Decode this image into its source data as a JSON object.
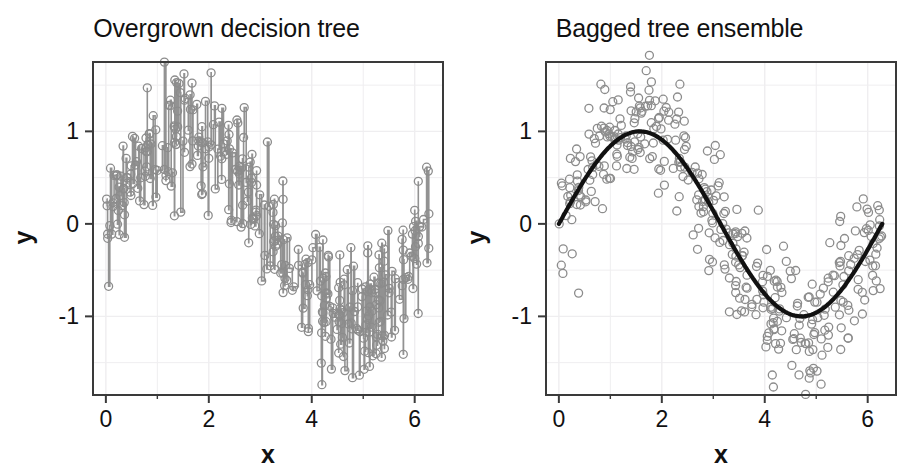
{
  "figure": {
    "background": "#ffffff",
    "panels": [
      {
        "id": "overgrown-decision-tree",
        "title": "Overgrown decision tree"
      },
      {
        "id": "bagged-tree-ensemble",
        "title": "Bagged tree ensemble"
      }
    ]
  },
  "axes": {
    "x_title": "x",
    "y_title": "y",
    "x_ticks": [
      "0",
      "2",
      "4",
      "6"
    ],
    "y_ticks": [
      "1",
      "0",
      "-1"
    ],
    "x_tick_values": [
      0,
      2,
      4,
      6
    ],
    "y_tick_values": [
      1,
      0,
      -1
    ]
  },
  "colors": {
    "point_stroke": "#8c8c8c",
    "fit_line": "#111111",
    "step_line": "#8c8c8c",
    "frame": "#3a3a3a",
    "grid": "#efeef0",
    "text": "#111111"
  },
  "chart_data": [
    {
      "type": "scatter",
      "title": "Overgrown decision tree",
      "xlabel": "x",
      "ylabel": "y",
      "xlim": [
        -0.25,
        6.55
      ],
      "ylim": [
        -1.85,
        1.75
      ],
      "xticks": [
        0,
        2,
        4,
        6
      ],
      "yticks": [
        -1,
        0,
        1
      ],
      "grid": true,
      "legend": "none",
      "annotation": "Noisy sine data with an overfit (fully grown) regression tree drawn as a dense step function connecting nearly every observation.",
      "series": [
        {
          "name": "observations",
          "marker": "open-circle",
          "color": "#8c8c8c",
          "n_points": 400,
          "generator": "y = sin(x) + N(0, 0.33), x ~ Uniform(0, 6.283)"
        },
        {
          "name": "overgrown tree fit",
          "type": "step",
          "color": "#8c8c8c",
          "generator": "piecewise-constant interpolation through every training observation"
        }
      ]
    },
    {
      "type": "scatter",
      "title": "Bagged tree ensemble",
      "xlabel": "x",
      "ylabel": "y",
      "xlim": [
        -0.25,
        6.55
      ],
      "ylim": [
        -1.85,
        1.75
      ],
      "xticks": [
        0,
        2,
        4,
        6
      ],
      "yticks": [
        -1,
        0,
        1
      ],
      "grid": true,
      "legend": "none",
      "annotation": "Same noisy sine data with a bagged tree ensemble producing a smooth sine-like fit.",
      "series": [
        {
          "name": "observations",
          "marker": "open-circle",
          "color": "#8c8c8c",
          "n_points": 400,
          "generator": "y = sin(x) + N(0, 0.33), x ~ Uniform(0, 6.283)"
        },
        {
          "name": "bagged ensemble fit",
          "type": "line",
          "color": "#111111",
          "generator": "y = sin(x), smooth averaged prediction"
        }
      ]
    }
  ]
}
